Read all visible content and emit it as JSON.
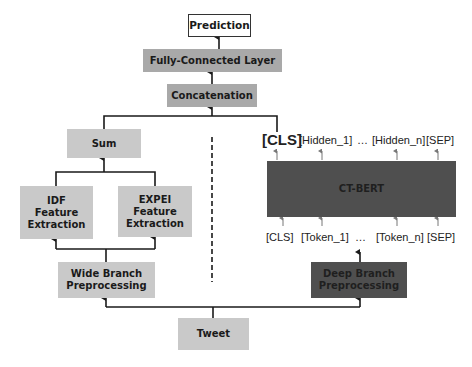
{
  "nodes": {
    "prediction": "Prediction",
    "fully_connected": "Fully-Connected Layer",
    "concatenation": "Concatenation",
    "sum": "Sum",
    "idf": [
      "IDF",
      "Feature",
      "Extraction"
    ],
    "expei": [
      "EXPEI",
      "Feature",
      "Extraction"
    ],
    "wide_branch": [
      "Wide Branch",
      "Preprocessing"
    ],
    "deep_branch": [
      "Deep Branch",
      "Preprocessing"
    ],
    "ct_bert": "CT-BERT",
    "tweet": "Tweet"
  },
  "outputs": {
    "cls": "[CLS]",
    "hidden_1": "[Hidden_1]",
    "ellipsis": "…",
    "hidden_n": "[Hidden_n]",
    "sep": "[SEP]"
  },
  "inputs": {
    "cls": "[CLS]",
    "token_1": "[Token_1]",
    "ellipsis": "…",
    "token_n": "[Token_n]",
    "sep": "[SEP]"
  },
  "colors": {
    "light_box": "#c9c9c9",
    "mid_box": "#a9a9a9",
    "dark_box": "#4f4f4f",
    "line": "#1a1a1a"
  }
}
